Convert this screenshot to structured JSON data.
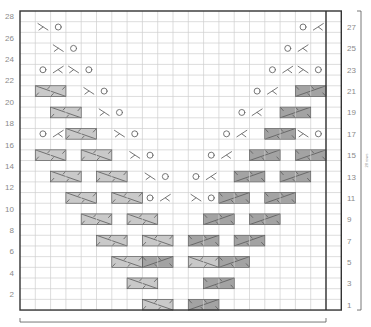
{
  "chart_data": {
    "type": "table",
    "title": "",
    "grid": {
      "columns": 21,
      "rows": 28,
      "repeat_columns": 20,
      "extra_columns": 1
    },
    "left_row_labels": [
      "2",
      "4",
      "6",
      "8",
      "10",
      "12",
      "14",
      "16",
      "18",
      "20",
      "22",
      "24",
      "26",
      "28"
    ],
    "right_row_labels": [
      "1",
      "3",
      "5",
      "7",
      "9",
      "11",
      "13",
      "15",
      "17",
      "19",
      "21",
      "23",
      "25",
      "27"
    ],
    "side_note": "28 rows",
    "symbols": {
      "O": "yarn-over",
      ">": "ssk-decrease",
      "<": "k2tog-decrease",
      "L": "cable-cross-light",
      "D": "cable-cross-dark"
    },
    "colors": {
      "light_cable": "#c9c9c9",
      "dark_cable": "#a3a3a3",
      "grid_line": "#cfcfcf",
      "border": "#333333",
      "symbol": "#666666",
      "label": "#8a8a8a"
    },
    "rows": [
      {
        "row": 27,
        "cells": [
          {
            "col": 2,
            "sym": ">"
          },
          {
            "col": 3,
            "sym": "O"
          },
          {
            "col": 19,
            "sym": "O"
          },
          {
            "col": 20,
            "sym": "<"
          }
        ]
      },
      {
        "row": 25,
        "cells": [
          {
            "col": 3,
            "sym": ">"
          },
          {
            "col": 4,
            "sym": "O"
          },
          {
            "col": 18,
            "sym": "O"
          },
          {
            "col": 19,
            "sym": "<"
          }
        ]
      },
      {
        "row": 23,
        "cells": [
          {
            "col": 2,
            "sym": "O"
          },
          {
            "col": 3,
            "sym": "<"
          },
          {
            "col": 4,
            "sym": ">"
          },
          {
            "col": 5,
            "sym": "O"
          },
          {
            "col": 17,
            "sym": "O"
          },
          {
            "col": 18,
            "sym": "<"
          },
          {
            "col": 19,
            "sym": ">"
          },
          {
            "col": 20,
            "sym": "O"
          }
        ]
      },
      {
        "row": 21,
        "cells": [
          {
            "col": 2,
            "sym": "L"
          },
          {
            "col": 5,
            "sym": ">"
          },
          {
            "col": 6,
            "sym": "O"
          },
          {
            "col": 16,
            "sym": "O"
          },
          {
            "col": 17,
            "sym": "<"
          },
          {
            "col": 19,
            "sym": "D"
          }
        ]
      },
      {
        "row": 19,
        "cells": [
          {
            "col": 3,
            "sym": "L"
          },
          {
            "col": 6,
            "sym": ">"
          },
          {
            "col": 7,
            "sym": "O"
          },
          {
            "col": 15,
            "sym": "O"
          },
          {
            "col": 16,
            "sym": "<"
          },
          {
            "col": 18,
            "sym": "D"
          }
        ]
      },
      {
        "row": 17,
        "cells": [
          {
            "col": 2,
            "sym": "O"
          },
          {
            "col": 3,
            "sym": "<"
          },
          {
            "col": 4,
            "sym": "L"
          },
          {
            "col": 7,
            "sym": ">"
          },
          {
            "col": 8,
            "sym": "O"
          },
          {
            "col": 14,
            "sym": "O"
          },
          {
            "col": 15,
            "sym": "<"
          },
          {
            "col": 17,
            "sym": "D"
          },
          {
            "col": 19,
            "sym": ">"
          },
          {
            "col": 20,
            "sym": "O"
          }
        ]
      },
      {
        "row": 15,
        "cells": [
          {
            "col": 2,
            "sym": "L"
          },
          {
            "col": 5,
            "sym": "L"
          },
          {
            "col": 8,
            "sym": ">"
          },
          {
            "col": 9,
            "sym": "O"
          },
          {
            "col": 13,
            "sym": "O"
          },
          {
            "col": 14,
            "sym": "<"
          },
          {
            "col": 16,
            "sym": "D"
          },
          {
            "col": 19,
            "sym": "D"
          }
        ]
      },
      {
        "row": 13,
        "cells": [
          {
            "col": 3,
            "sym": "L"
          },
          {
            "col": 6,
            "sym": "L"
          },
          {
            "col": 9,
            "sym": ">"
          },
          {
            "col": 10,
            "sym": "O"
          },
          {
            "col": 12,
            "sym": "O"
          },
          {
            "col": 13,
            "sym": "<"
          },
          {
            "col": 15,
            "sym": "D"
          },
          {
            "col": 18,
            "sym": "D"
          }
        ]
      },
      {
        "row": 11,
        "cells": [
          {
            "col": 4,
            "sym": "L"
          },
          {
            "col": 7,
            "sym": "L"
          },
          {
            "col": 9,
            "sym": "O"
          },
          {
            "col": 10,
            "sym": "<"
          },
          {
            "col": 12,
            "sym": ">"
          },
          {
            "col": 13,
            "sym": "O"
          },
          {
            "col": 14,
            "sym": "D"
          },
          {
            "col": 17,
            "sym": "D"
          }
        ]
      },
      {
        "row": 9,
        "cells": [
          {
            "col": 5,
            "sym": "L"
          },
          {
            "col": 8,
            "sym": "L"
          },
          {
            "col": 13,
            "sym": "D"
          },
          {
            "col": 16,
            "sym": "D"
          }
        ]
      },
      {
        "row": 7,
        "cells": [
          {
            "col": 6,
            "sym": "L"
          },
          {
            "col": 9,
            "sym": "L"
          },
          {
            "col": 12,
            "sym": "D"
          },
          {
            "col": 15,
            "sym": "D"
          }
        ]
      },
      {
        "row": 5,
        "cells": [
          {
            "col": 7,
            "sym": "L"
          },
          {
            "col": 9,
            "sym": "D"
          },
          {
            "col": 12,
            "sym": "L"
          },
          {
            "col": 14,
            "sym": "D"
          }
        ]
      },
      {
        "row": 3,
        "cells": [
          {
            "col": 8,
            "sym": "L"
          },
          {
            "col": 13,
            "sym": "D"
          }
        ]
      },
      {
        "row": 1,
        "cells": [
          {
            "col": 9,
            "sym": "L"
          },
          {
            "col": 12,
            "sym": "D"
          }
        ]
      }
    ]
  }
}
